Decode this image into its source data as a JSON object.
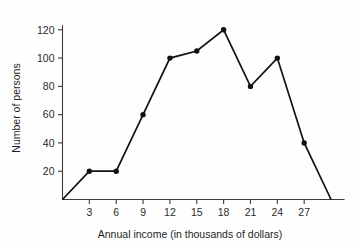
{
  "chart_data": {
    "type": "line",
    "title": "",
    "subtitle": "",
    "xlabel": "Annual income (in thousands of dollars)",
    "ylabel": "Number of persons",
    "x": [
      0,
      3,
      6,
      9,
      12,
      15,
      18,
      21,
      24,
      27,
      30
    ],
    "values": [
      0,
      20,
      20,
      60,
      100,
      105,
      120,
      80,
      100,
      40,
      0
    ],
    "series": [
      {
        "name": "Number of persons",
        "values": [
          0,
          20,
          20,
          60,
          100,
          105,
          120,
          80,
          100,
          40,
          0
        ]
      }
    ],
    "points": [
      {
        "x": 0,
        "y": 0,
        "marker": false
      },
      {
        "x": 3,
        "y": 20,
        "marker": true
      },
      {
        "x": 6,
        "y": 20,
        "marker": true
      },
      {
        "x": 9,
        "y": 60,
        "marker": true
      },
      {
        "x": 12,
        "y": 100,
        "marker": true
      },
      {
        "x": 15,
        "y": 105,
        "marker": true
      },
      {
        "x": 18,
        "y": 120,
        "marker": true
      },
      {
        "x": 21,
        "y": 80,
        "marker": true
      },
      {
        "x": 24,
        "y": 100,
        "marker": true
      },
      {
        "x": 27,
        "y": 40,
        "marker": true
      },
      {
        "x": 30,
        "y": 0,
        "marker": false
      }
    ],
    "xticks": [
      3,
      6,
      9,
      12,
      15,
      18,
      21,
      24,
      27
    ],
    "xtick_labels": [
      "3",
      "6",
      "9",
      "12",
      "15",
      "18",
      "21",
      "24",
      "27"
    ],
    "yticks": [
      20,
      40,
      60,
      80,
      100,
      120
    ],
    "ytick_labels": [
      "20",
      "40",
      "60",
      "80",
      "100",
      "120"
    ],
    "xlim": [
      0,
      31
    ],
    "ylim": [
      0,
      128
    ],
    "grid": false,
    "legend": false,
    "legend_position": "none",
    "line_color": "#111111",
    "marker_color": "#111111",
    "axis_color": "#3c3c3c",
    "background_color": "#fefefe"
  }
}
